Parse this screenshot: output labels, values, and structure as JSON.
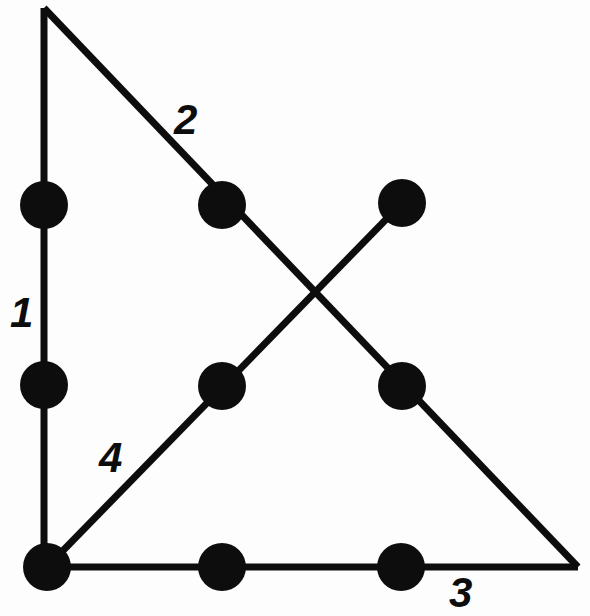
{
  "figure": {
    "canvas": {
      "width": 590,
      "height": 616
    },
    "colors": {
      "background": "#fdfdfd",
      "stroke": "#0d0d0d",
      "node_fill": "#0d0d0d",
      "label_color": "#0d0d0d"
    },
    "stroke_width": 7,
    "node_radius": 24,
    "vertices": {
      "apex": {
        "x": 44,
        "y": 8
      },
      "bottom_left": {
        "x": 47,
        "y": 567
      },
      "bottom_right": {
        "x": 578,
        "y": 567
      },
      "upper_right_end": {
        "x": 402,
        "y": 203
      }
    },
    "segments": [
      {
        "id": "segment-1",
        "label": "1",
        "label_position": {
          "x": 10,
          "y": 292
        },
        "from": {
          "x": 44,
          "y": 8
        },
        "to": {
          "x": 44,
          "y": 567
        },
        "orientation": "vertical"
      },
      {
        "id": "segment-2",
        "label": "2",
        "label_position": {
          "x": 174,
          "y": 99
        },
        "from": {
          "x": 44,
          "y": 8
        },
        "to": {
          "x": 578,
          "y": 567
        },
        "orientation": "diagonal-down-right"
      },
      {
        "id": "segment-3",
        "label": "3",
        "label_position": {
          "x": 449,
          "y": 572
        },
        "from": {
          "x": 47,
          "y": 567
        },
        "to": {
          "x": 578,
          "y": 567
        },
        "orientation": "horizontal"
      },
      {
        "id": "segment-4",
        "label": "4",
        "label_position": {
          "x": 99,
          "y": 437
        },
        "from": {
          "x": 47,
          "y": 567
        },
        "to": {
          "x": 402,
          "y": 203
        },
        "orientation": "diagonal-up-right"
      }
    ],
    "nodes": [
      {
        "id": "node-seg1-upper",
        "on_segment": "1",
        "x": 44,
        "y": 205
      },
      {
        "id": "node-seg1-lower",
        "on_segment": "1",
        "x": 44,
        "y": 385
      },
      {
        "id": "node-seg2-upper",
        "on_segment": "2",
        "x": 222,
        "y": 205
      },
      {
        "id": "node-seg2-lower",
        "on_segment": "2",
        "x": 402,
        "y": 386
      },
      {
        "id": "node-seg4-upper-end",
        "on_segment": "4",
        "x": 402,
        "y": 203
      },
      {
        "id": "node-seg4-middle",
        "on_segment": "4",
        "x": 222,
        "y": 386
      },
      {
        "id": "node-seg3-left-corner",
        "on_segment": "3",
        "x": 47,
        "y": 567
      },
      {
        "id": "node-seg3-middle",
        "on_segment": "3",
        "x": 222,
        "y": 567
      },
      {
        "id": "node-seg3-right",
        "on_segment": "3",
        "x": 401,
        "y": 567
      }
    ],
    "crossing_point": {
      "x": 313,
      "y": 290
    }
  }
}
